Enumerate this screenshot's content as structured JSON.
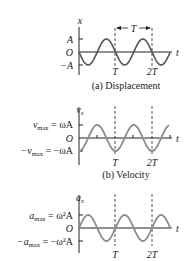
{
  "panels": [
    {
      "id": "a",
      "caption": "(a) Displacement",
      "y_axis_label": "x",
      "t_label": "t",
      "origin_label": "O",
      "top_label": "A",
      "bottom_label": "−A",
      "period_marker": "T",
      "tick_labels": [
        "T",
        "2T"
      ]
    },
    {
      "id": "b",
      "caption": "(b) Velocity",
      "y_axis_label": "v",
      "y_axis_sub": "x",
      "t_label": "t",
      "origin_label": "O",
      "top_label_lhs": "v",
      "top_label_sub": "max",
      "top_label_rhs": " = ωA",
      "bottom_label_lhs": "−v",
      "bottom_label_sub": "max",
      "bottom_label_rhs": " = −ωA",
      "tick_labels": [
        "T",
        "2T"
      ]
    },
    {
      "id": "c",
      "caption": "",
      "y_axis_label": "a",
      "y_axis_sub": "x",
      "t_label": "t",
      "origin_label": "O",
      "top_label_lhs": "a",
      "top_label_sub": "max",
      "top_label_rhs": " = ω²A",
      "bottom_label_lhs": "−a",
      "bottom_label_sub": "max",
      "bottom_label_rhs": " = −ω²A",
      "tick_labels": [
        "T",
        "2T"
      ]
    }
  ],
  "colors": {
    "curve": "#5a5a5a",
    "axis": "#222222",
    "curve_gray": "#8c8c8c"
  }
}
